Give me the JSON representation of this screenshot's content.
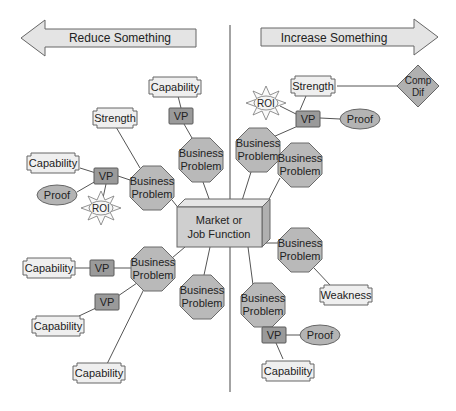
{
  "diagram": {
    "arrows": {
      "left": {
        "label": "Reduce Something"
      },
      "right": {
        "label": "Increase Something"
      }
    },
    "center": {
      "line1": "Market or",
      "line2": "Job Function"
    },
    "business_problems": [
      {
        "id": "bp-top-left",
        "line1": "Business",
        "line2": "Problem"
      },
      {
        "id": "bp-left",
        "line1": "Business",
        "line2": "Problem"
      },
      {
        "id": "bp-top-right",
        "line1": "Business",
        "line2": "Problem"
      },
      {
        "id": "bp-right-upper",
        "line1": "Business",
        "line2": "Problem"
      },
      {
        "id": "bp-right-lower",
        "line1": "Business",
        "line2": "Problem"
      },
      {
        "id": "bp-lower-left",
        "line1": "Business",
        "line2": "Problem"
      },
      {
        "id": "bp-bottom-left",
        "line1": "Business",
        "line2": "Problem"
      },
      {
        "id": "bp-bottom-right",
        "line1": "Business",
        "line2": "Problem"
      }
    ],
    "nodes": {
      "capability_top": "Capability",
      "vp_top": "VP",
      "strength_left": "Strength",
      "capability_left": "Capability",
      "vp_left": "VP",
      "proof_left": "Proof",
      "roi_left": "ROI",
      "roi_right": "ROI",
      "strength_right": "Strength",
      "comp_dif_line1": "Comp",
      "comp_dif_line2": "Dif",
      "vp_right": "VP",
      "proof_right": "Proof",
      "capability_lower_left": "Capability",
      "vp_lower_left": "VP",
      "vp_lower_left_2": "VP",
      "capability_lower_left_2": "Capability",
      "capability_bottom_left": "Capability",
      "weakness": "Weakness",
      "vp_bottom_right": "VP",
      "proof_bottom_right": "Proof",
      "capability_bottom_right": "Capability"
    }
  }
}
